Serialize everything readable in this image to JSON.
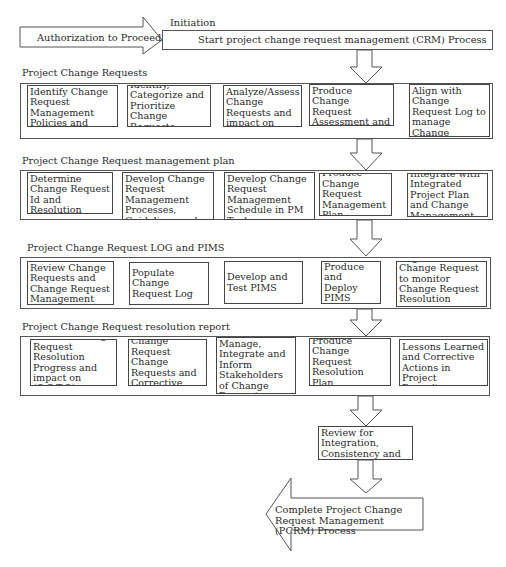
{
  "initiation": {
    "label": "Initiation",
    "input_arrow": "Authorization to Proceed",
    "start_box": "Start project change request management (CRM) Process"
  },
  "phases": [
    {
      "title": "Project Change Requests",
      "steps": [
        "Identify Change Request Management Policies and Templates (PMO)",
        "Identify, Categorize and Prioritize Change Requests",
        "Analyze/Assess Change Requests and impact on (S,C,T,Q)",
        "Produce Change Request Assessment and Resolution Strategies",
        "Align with Change Request Log to manage Change Request Resolution Progress"
      ]
    },
    {
      "title": "Project Change Request management plan",
      "steps": [
        "Determine Change Request Id and Resolution Criteria-Checklists (PMO)",
        "Develop Change Request Management Processes, Guidelines and Schedule",
        "Develop Change Request Management Schedule in PM Tools",
        "Produce Change Request Management Plan",
        "Integrate with Integrated Project Plan and Change Management"
      ]
    },
    {
      "title": "Project Change Request LOG and PIMS",
      "steps": [
        "Review Change Requests and Change Request Management Plan",
        "Populate Change Request Log",
        "Develop and Test PIMS",
        "Produce and Deploy PIMS",
        "Align with Change Request to monitor Change Request Resolution progress"
      ]
    },
    {
      "title": "Project Change Request resolution report",
      "steps": [
        "Monitor Change Request Resolution Progress and impact on (S,C,T,Q)",
        "Generate Change Request Change Requests and Corrective Actions",
        "Manage, Integrate and Inform Stakeholders of Change Request Changes",
        "Produce Change Request Resolution Plan",
        "Document Lessons Learned and Corrective Actions in Project Repository"
      ]
    }
  ],
  "review": "Review for Integration, Consistency and Completeness",
  "completion_arrow": "Complete Project Change Request Management  (PCRM) Process"
}
